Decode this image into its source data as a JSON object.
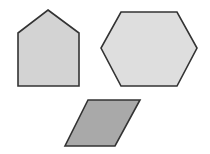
{
  "canvas": {
    "width": 210,
    "height": 154,
    "background": "#ffffff"
  },
  "shapes": [
    {
      "id": "pentagon",
      "label": "pentagon",
      "points": "48,10 79,33 79,86 18,86 18,33",
      "fill": "#d3d3d3",
      "stroke": "#333333"
    },
    {
      "id": "hexagon",
      "label": "hexagon",
      "points": "121,12 177,12 197,48 177,86 121,86 101,48",
      "fill": "#dedede",
      "stroke": "#333333"
    },
    {
      "id": "parallelogram",
      "label": "parallelogram",
      "points": "88,100 140,100 115,146 65,146",
      "fill": "#a9a9a9",
      "stroke": "#333333"
    }
  ]
}
